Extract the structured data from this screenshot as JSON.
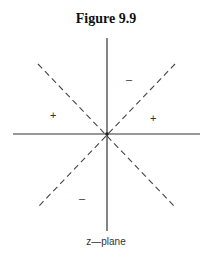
{
  "figure": {
    "title": "Figure 9.9",
    "caption": "z—plane",
    "region_signs": {
      "upper": "–",
      "left": "+",
      "right": "+",
      "lower": "–"
    }
  }
}
